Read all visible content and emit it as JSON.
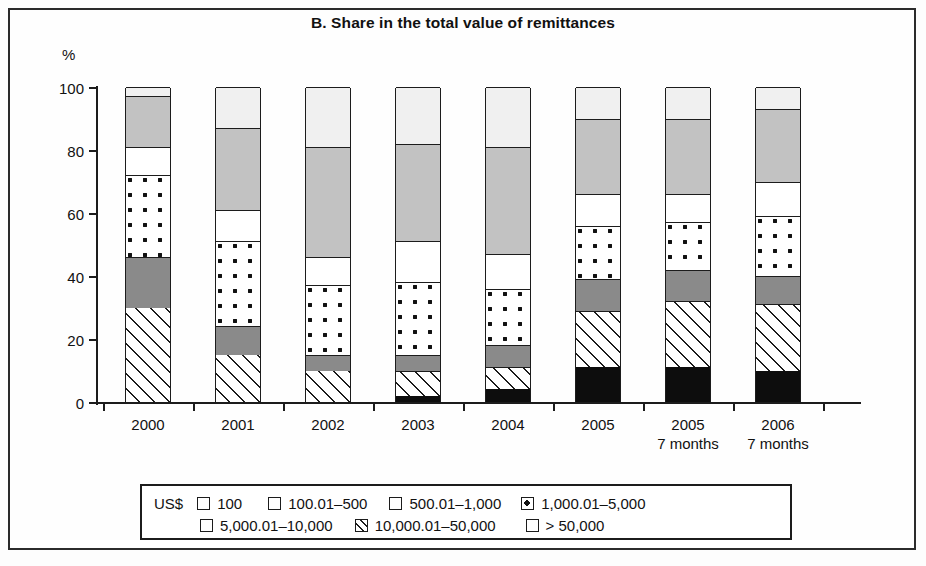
{
  "figure": {
    "title": "B. Share in the total value of remittances",
    "y_axis_unit": "%"
  },
  "legend": {
    "currency_label": "US$",
    "entries": [
      {
        "label": "100",
        "pattern": "light-gray-solid",
        "key": "100"
      },
      {
        "label": "100.01–500",
        "pattern": "medium-gray-solid",
        "key": "100.01-500"
      },
      {
        "label": "500.01–1,000",
        "pattern": "white-solid",
        "key": "500.01-1000"
      },
      {
        "label": "1,000.01–5,000",
        "pattern": "dotted",
        "key": "1000.01-5000"
      },
      {
        "label": "5,000.01–10,000",
        "pattern": "dark-gray-solid",
        "key": "5000.01-10000"
      },
      {
        "label": "10,000.01–50,000",
        "pattern": "diagonal-hatch",
        "key": "10000.01-50000"
      },
      {
        "label": "> 50,000",
        "pattern": "black-solid",
        "key": "gt-50000"
      }
    ]
  },
  "chart_data": {
    "type": "bar",
    "stacked": true,
    "title": "B. Share in the total value of remittances",
    "xlabel": "",
    "ylabel": "%",
    "ylim": [
      0,
      100
    ],
    "yticks": [
      0,
      20,
      40,
      60,
      80,
      100
    ],
    "grid": false,
    "legend_position": "bottom",
    "categories": [
      "2000",
      "2001",
      "2002",
      "2003",
      "2004",
      "2005",
      "2005",
      "2006"
    ],
    "category_sublabels": [
      "",
      "",
      "",
      "",
      "",
      "",
      "7 months",
      "7 months"
    ],
    "series": [
      {
        "name": "> 50,000",
        "values": [
          0,
          0,
          0,
          2,
          4,
          11,
          11,
          10
        ]
      },
      {
        "name": "10,000.01–50,000",
        "values": [
          30,
          15,
          10,
          8,
          7,
          18,
          21,
          21
        ]
      },
      {
        "name": "5,000.01–10,000",
        "values": [
          16,
          9,
          5,
          5,
          7,
          10,
          10,
          9
        ]
      },
      {
        "name": "1,000.01–5,000",
        "values": [
          26,
          27,
          22,
          23,
          18,
          17,
          15,
          19
        ]
      },
      {
        "name": "500.01–1,000",
        "values": [
          9,
          10,
          9,
          13,
          11,
          10,
          9,
          11
        ]
      },
      {
        "name": "100.01–500",
        "values": [
          16,
          26,
          35,
          31,
          34,
          24,
          24,
          23
        ]
      },
      {
        "name": "100",
        "values": [
          3,
          13,
          19,
          18,
          19,
          10,
          10,
          7
        ]
      }
    ]
  },
  "bars": [
    {
      "label": "2000",
      "sublabel": "",
      "segments": [
        {
          "key": "gt-50000",
          "value": 0,
          "start": 0,
          "end": 0
        },
        {
          "key": "10000.01-50000",
          "value": 30,
          "start": 0,
          "end": 30
        },
        {
          "key": "5000.01-10000",
          "value": 16,
          "start": 30,
          "end": 46
        },
        {
          "key": "1000.01-5000",
          "value": 26,
          "start": 46,
          "end": 72
        },
        {
          "key": "500.01-1000",
          "value": 9,
          "start": 72,
          "end": 81
        },
        {
          "key": "100.01-500",
          "value": 16,
          "start": 81,
          "end": 97
        },
        {
          "key": "100",
          "value": 3,
          "start": 97,
          "end": 100
        }
      ]
    },
    {
      "label": "2001",
      "sublabel": "",
      "segments": [
        {
          "key": "gt-50000",
          "value": 0,
          "start": 0,
          "end": 0
        },
        {
          "key": "10000.01-50000",
          "value": 15,
          "start": 0,
          "end": 15
        },
        {
          "key": "5000.01-10000",
          "value": 9,
          "start": 15,
          "end": 24
        },
        {
          "key": "1000.01-5000",
          "value": 27,
          "start": 24,
          "end": 51
        },
        {
          "key": "500.01-1000",
          "value": 10,
          "start": 51,
          "end": 61
        },
        {
          "key": "100.01-500",
          "value": 26,
          "start": 61,
          "end": 87
        },
        {
          "key": "100",
          "value": 13,
          "start": 87,
          "end": 100
        }
      ]
    },
    {
      "label": "2002",
      "sublabel": "",
      "segments": [
        {
          "key": "gt-50000",
          "value": 0,
          "start": 0,
          "end": 0
        },
        {
          "key": "10000.01-50000",
          "value": 10,
          "start": 0,
          "end": 10
        },
        {
          "key": "5000.01-10000",
          "value": 5,
          "start": 10,
          "end": 15
        },
        {
          "key": "1000.01-5000",
          "value": 22,
          "start": 15,
          "end": 37
        },
        {
          "key": "500.01-1000",
          "value": 9,
          "start": 37,
          "end": 46
        },
        {
          "key": "100.01-500",
          "value": 35,
          "start": 46,
          "end": 81
        },
        {
          "key": "100",
          "value": 19,
          "start": 81,
          "end": 100
        }
      ]
    },
    {
      "label": "2003",
      "sublabel": "",
      "segments": [
        {
          "key": "gt-50000",
          "value": 2,
          "start": 0,
          "end": 2
        },
        {
          "key": "10000.01-50000",
          "value": 8,
          "start": 2,
          "end": 10
        },
        {
          "key": "5000.01-10000",
          "value": 5,
          "start": 10,
          "end": 15
        },
        {
          "key": "1000.01-5000",
          "value": 23,
          "start": 15,
          "end": 38
        },
        {
          "key": "500.01-1000",
          "value": 13,
          "start": 38,
          "end": 51
        },
        {
          "key": "100.01-500",
          "value": 31,
          "start": 51,
          "end": 82
        },
        {
          "key": "100",
          "value": 18,
          "start": 82,
          "end": 100
        }
      ]
    },
    {
      "label": "2004",
      "sublabel": "",
      "segments": [
        {
          "key": "gt-50000",
          "value": 4,
          "start": 0,
          "end": 4
        },
        {
          "key": "10000.01-50000",
          "value": 7,
          "start": 4,
          "end": 11
        },
        {
          "key": "5000.01-10000",
          "value": 7,
          "start": 11,
          "end": 18
        },
        {
          "key": "1000.01-5000",
          "value": 18,
          "start": 18,
          "end": 36
        },
        {
          "key": "500.01-1000",
          "value": 11,
          "start": 36,
          "end": 47
        },
        {
          "key": "100.01-500",
          "value": 34,
          "start": 47,
          "end": 81
        },
        {
          "key": "100",
          "value": 19,
          "start": 81,
          "end": 100
        }
      ]
    },
    {
      "label": "2005",
      "sublabel": "",
      "segments": [
        {
          "key": "gt-50000",
          "value": 11,
          "start": 0,
          "end": 11
        },
        {
          "key": "10000.01-50000",
          "value": 18,
          "start": 11,
          "end": 29
        },
        {
          "key": "5000.01-10000",
          "value": 10,
          "start": 29,
          "end": 39
        },
        {
          "key": "1000.01-5000",
          "value": 17,
          "start": 39,
          "end": 56
        },
        {
          "key": "500.01-1000",
          "value": 10,
          "start": 56,
          "end": 66
        },
        {
          "key": "100.01-500",
          "value": 24,
          "start": 66,
          "end": 90
        },
        {
          "key": "100",
          "value": 10,
          "start": 90,
          "end": 100
        }
      ]
    },
    {
      "label": "2005",
      "sublabel": "7 months",
      "segments": [
        {
          "key": "gt-50000",
          "value": 11,
          "start": 0,
          "end": 11
        },
        {
          "key": "10000.01-50000",
          "value": 21,
          "start": 11,
          "end": 32
        },
        {
          "key": "5000.01-10000",
          "value": 10,
          "start": 32,
          "end": 42
        },
        {
          "key": "1000.01-5000",
          "value": 15,
          "start": 42,
          "end": 57
        },
        {
          "key": "500.01-1000",
          "value": 9,
          "start": 57,
          "end": 66
        },
        {
          "key": "100.01-500",
          "value": 24,
          "start": 66,
          "end": 90
        },
        {
          "key": "100",
          "value": 10,
          "start": 90,
          "end": 100
        }
      ]
    },
    {
      "label": "2006",
      "sublabel": "7 months",
      "segments": [
        {
          "key": "gt-50000",
          "value": 10,
          "start": 0,
          "end": 10
        },
        {
          "key": "10000.01-50000",
          "value": 21,
          "start": 10,
          "end": 31
        },
        {
          "key": "5000.01-10000",
          "value": 9,
          "start": 31,
          "end": 40
        },
        {
          "key": "1000.01-5000",
          "value": 19,
          "start": 40,
          "end": 59
        },
        {
          "key": "500.01-1000",
          "value": 11,
          "start": 59,
          "end": 70
        },
        {
          "key": "100.01-500",
          "value": 23,
          "start": 70,
          "end": 93
        },
        {
          "key": "100",
          "value": 7,
          "start": 93,
          "end": 100
        }
      ]
    }
  ]
}
